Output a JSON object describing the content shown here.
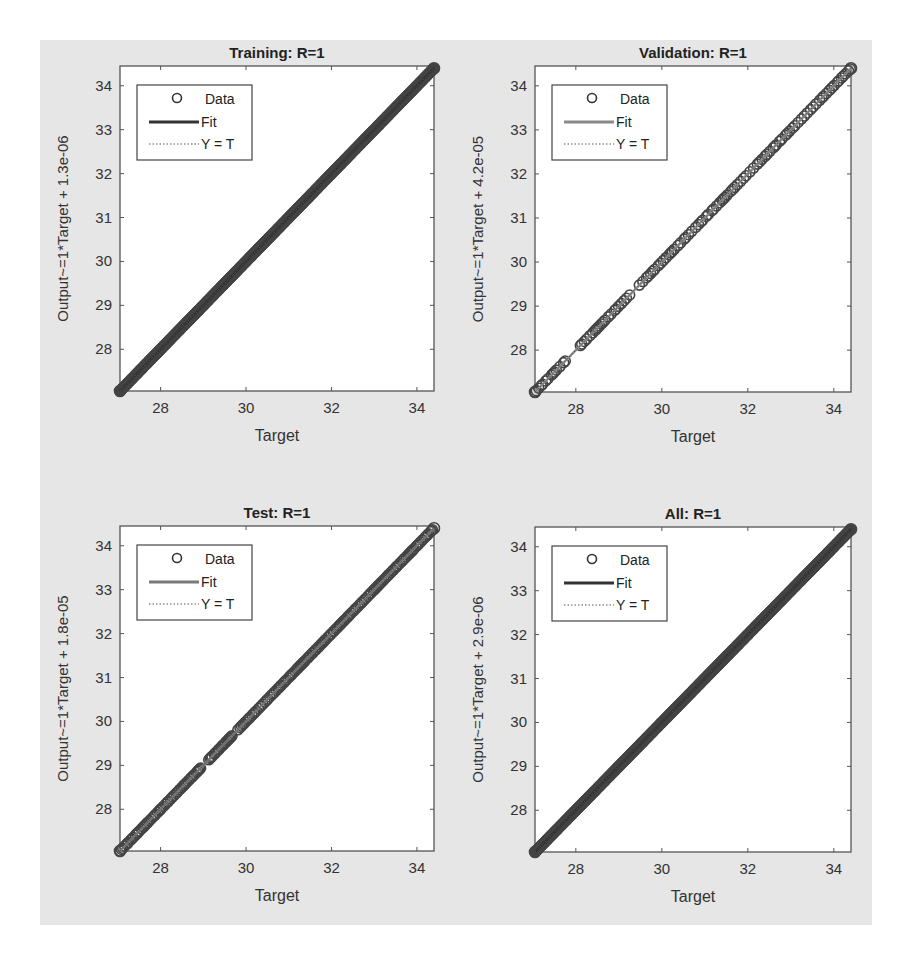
{
  "figure": {
    "background": "#e6e6e6",
    "axes_color": "#555555",
    "data_color": "#444444"
  },
  "chart_data": [
    {
      "type": "scatter",
      "title": "Training: R=1",
      "xlabel": "Target",
      "ylabel": "Output~=1*Target + 1.3e-06",
      "xlim": [
        27.05,
        34.4
      ],
      "ylim": [
        27.05,
        34.45
      ],
      "xticks": [
        28,
        30,
        32,
        34
      ],
      "yticks": [
        28,
        29,
        30,
        31,
        32,
        33,
        34
      ],
      "grid": false,
      "legend": {
        "position": "upper-left",
        "entries": [
          "Data",
          "Fit",
          "Y = T"
        ]
      },
      "fit": {
        "slope": 1,
        "intercept": 1.3e-06,
        "color": "#333333"
      },
      "density": "dense",
      "data_range": [
        27.05,
        34.4
      ],
      "gaps": []
    },
    {
      "type": "scatter",
      "title": "Validation: R=1",
      "xlabel": "Target",
      "ylabel": "Output~=1*Target + 4.2e-05",
      "xlim": [
        27.05,
        34.4
      ],
      "ylim": [
        27.05,
        34.45
      ],
      "xticks": [
        28,
        30,
        32,
        34
      ],
      "yticks": [
        28,
        29,
        30,
        31,
        32,
        33,
        34
      ],
      "grid": false,
      "legend": {
        "position": "upper-left",
        "entries": [
          "Data",
          "Fit",
          "Y = T"
        ]
      },
      "fit": {
        "slope": 1,
        "intercept": 4.2e-05,
        "color": "#8a8a8a"
      },
      "density": "sparse",
      "data_range": [
        27.05,
        34.4
      ],
      "gaps": [
        [
          27.8,
          28.1
        ],
        [
          29.3,
          29.45
        ]
      ]
    },
    {
      "type": "scatter",
      "title": "Test: R=1",
      "xlabel": "Target",
      "ylabel": "Output~=1*Target + 1.8e-05",
      "xlim": [
        27.05,
        34.4
      ],
      "ylim": [
        27.05,
        34.45
      ],
      "xticks": [
        28,
        30,
        32,
        34
      ],
      "yticks": [
        28,
        29,
        30,
        31,
        32,
        33,
        34
      ],
      "grid": false,
      "legend": {
        "position": "upper-left",
        "entries": [
          "Data",
          "Fit",
          "Y = T"
        ]
      },
      "fit": {
        "slope": 1,
        "intercept": 1.8e-05,
        "color": "#7a7a7a"
      },
      "density": "medium",
      "data_range": [
        27.05,
        34.4
      ],
      "gaps": [
        [
          28.95,
          29.1
        ],
        [
          29.7,
          29.8
        ]
      ]
    },
    {
      "type": "scatter",
      "title": "All: R=1",
      "xlabel": "Target",
      "ylabel": "Output~=1*Target + 2.9e-06",
      "xlim": [
        27.05,
        34.4
      ],
      "ylim": [
        27.05,
        34.45
      ],
      "xticks": [
        28,
        30,
        32,
        34
      ],
      "yticks": [
        28,
        29,
        30,
        31,
        32,
        33,
        34
      ],
      "grid": false,
      "legend": {
        "position": "upper-left",
        "entries": [
          "Data",
          "Fit",
          "Y = T"
        ]
      },
      "fit": {
        "slope": 1,
        "intercept": 2.9e-06,
        "color": "#333333"
      },
      "density": "dense",
      "data_range": [
        27.05,
        34.4
      ],
      "gaps": []
    }
  ]
}
